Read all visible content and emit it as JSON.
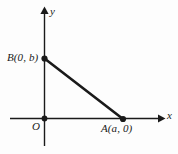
{
  "figure": {
    "background_color": "#fdfdfd",
    "stroke_color": "#1a1a1a",
    "axis_color": "#1a1a1a"
  },
  "axes": {
    "x_label": "x",
    "y_label": "y",
    "origin_label": "O"
  },
  "points": [
    {
      "name": "B",
      "label": "B(0, b)",
      "x": 0,
      "y": "b"
    },
    {
      "name": "A",
      "label": "A(a, 0)",
      "x": "a",
      "y": 0
    },
    {
      "name": "O",
      "label": "O",
      "x": 0,
      "y": 0
    }
  ],
  "segments": [
    {
      "name": "hypotenuse",
      "from": "B",
      "to": "A"
    }
  ],
  "geometry": {
    "origin_px": {
      "x": 44,
      "y": 118
    },
    "point_b_px": {
      "x": 44,
      "y": 58
    },
    "point_a_px": {
      "x": 123,
      "y": 119
    },
    "x_axis_start_px": 10,
    "x_axis_end_px": 163,
    "y_axis_top_px": 8,
    "y_axis_bottom_px": 146
  }
}
